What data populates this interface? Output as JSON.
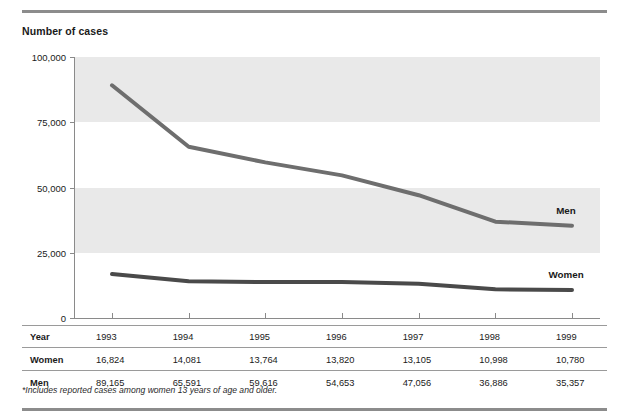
{
  "figure": {
    "axis_title": "Number of cases",
    "footnote": "*Includes reported cases among women 13 years of age and older.",
    "row_label_year": "Year",
    "row_label_women": "Women",
    "row_label_men": "Men",
    "colors": {
      "band": "#e9e9e9",
      "men_line": "#6e6e6e",
      "women_line": "#4a4a4a",
      "rule": "#8c8c8c",
      "axis": "#8a8a8a"
    }
  },
  "chart_data": {
    "type": "line",
    "title": "",
    "xlabel": "Year",
    "ylabel": "Number of cases",
    "categories": [
      "1993",
      "1994",
      "1995",
      "1996",
      "1997",
      "1998",
      "1999"
    ],
    "x": [
      1993,
      1994,
      1995,
      1996,
      1997,
      1998,
      1999
    ],
    "ylim": [
      0,
      100000
    ],
    "yticks": [
      0,
      25000,
      50000,
      75000,
      100000
    ],
    "ytick_labels": [
      "0",
      "25,000",
      "50,000",
      "75,000",
      "100,000"
    ],
    "grid": false,
    "banded_background": true,
    "bands": [
      [
        75000,
        100000
      ],
      [
        25000,
        50000
      ]
    ],
    "legend": "inline-labels",
    "series": [
      {
        "name": "Men",
        "color": "#6e6e6e",
        "values": [
          89165,
          65591,
          59616,
          54653,
          47056,
          36886,
          35357
        ],
        "labels": [
          "89,165",
          "65,591",
          "59,616",
          "54,653",
          "47,056",
          "36,886",
          "35,357"
        ]
      },
      {
        "name": "Women",
        "color": "#4a4a4a",
        "values": [
          16824,
          14081,
          13764,
          13820,
          13105,
          10998,
          10780
        ],
        "labels": [
          "16,824",
          "14,081",
          "13,764",
          "13,820",
          "13,105",
          "10,998",
          "10,780"
        ]
      }
    ],
    "annotations": [
      "*Includes reported cases among women 13 years of age and older."
    ]
  }
}
